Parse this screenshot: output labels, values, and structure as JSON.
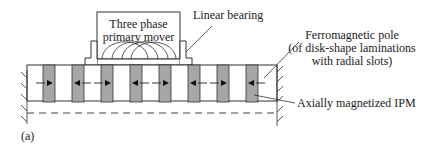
{
  "labels": {
    "mover_line1": "Three phase",
    "mover_line2": "primary mover",
    "bearing": "Linear bearing",
    "pole_line1": "Ferromagnetic pole",
    "pole_line2": "(of disk-shape laminations",
    "pole_line3": "with radial slots)",
    "ipm": "Axially magnetized IPM",
    "figure_tag": "(a)"
  },
  "magnets": [
    {
      "direction": "right"
    },
    {
      "direction": "left"
    },
    {
      "direction": "right"
    },
    {
      "direction": "left"
    },
    {
      "direction": "right"
    },
    {
      "direction": "left"
    },
    {
      "direction": "right"
    },
    {
      "direction": "left"
    }
  ],
  "colors": {
    "magnet_fill": "#a6a6a6",
    "line": "#333333"
  }
}
